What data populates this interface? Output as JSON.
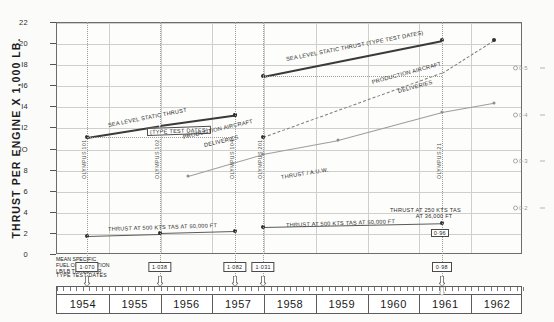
{
  "chart_data": {
    "type": "line",
    "title": "",
    "xlabel": "",
    "ylabel": "THRUST PER ENGINE X 1,000 LB.",
    "xlim": [
      1954,
      1963
    ],
    "ylim": [
      0,
      22
    ],
    "yticks": [
      0,
      2,
      4,
      6,
      8,
      10,
      12,
      14,
      16,
      18,
      20,
      22
    ],
    "ytick_labels": [
      "0",
      "2",
      "4",
      "6",
      "8",
      "IO",
      "I2",
      "I4",
      "I6",
      "I8",
      "20",
      "22"
    ],
    "right_axis_label": "",
    "right_ticks": [
      0.2,
      0.3,
      0.4,
      0.5
    ],
    "right_tick_labels": [
      "0·2",
      "0·3",
      "0·4",
      "0·5"
    ],
    "xtick_labels": [
      "1954",
      "1955",
      "1956",
      "1957",
      "1958",
      "1959",
      "1960",
      "1961",
      "1962"
    ],
    "grid": true,
    "legend_position": "inline-annotations",
    "series": [
      {
        "name": "SEA LEVEL STATIC THRUST (TYPE TEST DATES)",
        "style": "solid-thick",
        "axis": "left",
        "x": [
          1954.6,
          1956.0,
          1957.45,
          1958.0,
          1961.45
        ],
        "y": [
          11.1,
          12.2,
          13.2,
          16.9,
          20.3
        ],
        "markers": [
          true,
          false,
          true,
          true,
          true
        ]
      },
      {
        "name": "PRODUCTION AIRCRAFT DELIVERIES",
        "style": "dashed",
        "axis": "left",
        "x": [
          1957.45,
          1958.0,
          1961.45,
          1962.45
        ],
        "y": [
          13.2,
          11.1,
          17.2,
          20.3
        ],
        "markers": [
          true,
          true,
          false,
          true
        ]
      },
      {
        "name": "THRUST / A.U.W.",
        "style": "solid-thin",
        "axis": "right",
        "x": [
          1956.55,
          1958.0,
          1959.45,
          1961.45,
          1962.45
        ],
        "y": [
          0.268,
          0.315,
          0.345,
          0.405,
          0.425
        ],
        "markers": [
          true,
          true,
          true,
          true,
          true
        ]
      },
      {
        "name": "THRUST AT 500 KTS TAS AT 50,000 FT",
        "style": "solid-med",
        "axis": "left",
        "x": [
          1954.6,
          1956.0,
          1957.45
        ],
        "y": [
          1.75,
          1.95,
          2.15
        ],
        "markers": [
          true,
          true,
          true
        ]
      },
      {
        "name": "THRUST AT 250 KTS TAS AT 36,000 FT",
        "style": "solid-med",
        "axis": "left",
        "x": [
          1958.0,
          1961.45
        ],
        "y": [
          2.55,
          2.9
        ],
        "markers": [
          true,
          true
        ]
      }
    ],
    "annotations": [
      {
        "text": "SEA LEVEL STATIC THRUST",
        "kind": "line-label"
      },
      {
        "text": "(TYPE TEST DATES)",
        "kind": "line-label-box"
      },
      {
        "text": "SEA LEVEL STATIC THRUST  (TYPE TEST DATES)",
        "kind": "line-label"
      },
      {
        "text": "PRODUCTION AIRCRAFT",
        "kind": "line-label"
      },
      {
        "text": "DELIVERIES",
        "kind": "line-label"
      },
      {
        "text": "PRODUCTION AIRCRAFT",
        "kind": "line-label"
      },
      {
        "text": "DELIVERIES",
        "kind": "line-label"
      },
      {
        "text": "THRUST / A.U.W.",
        "kind": "line-label"
      },
      {
        "text": "THRUST AT 500 KTS TAS AT 50,000 FT",
        "kind": "line-label"
      },
      {
        "text": "THRUST AT 500 KTS TAS AT 50,000 FT",
        "kind": "line-label"
      },
      {
        "text": "THRUST AT 250 KTS TAS",
        "kind": "line-label"
      },
      {
        "text": "AT 36,000 FT",
        "kind": "line-label"
      }
    ],
    "engine_markers": [
      {
        "label": "OLYMPUS 101",
        "x": 1954.6
      },
      {
        "label": "OLYMPUS 102",
        "x": 1956.0
      },
      {
        "label": "OLYMPUS 104",
        "x": 1957.45
      },
      {
        "label": "OLYMPUS 201",
        "x": 1958.0
      },
      {
        "label": "OLYMPUS 21",
        "x": 1961.45
      }
    ],
    "fuel_consumption": {
      "caption_line1": "MEAN SPECIFIC",
      "caption_line2": "FUEL CONSUMPTION",
      "caption_line3": "LB/LB THRUST/HR.",
      "type_test_caption": "TYPE TEST DATES",
      "values": [
        {
          "value": "1·070",
          "x": 1954.6
        },
        {
          "value": "1·038",
          "x": 1956.0
        },
        {
          "value": "1·082",
          "x": 1957.45
        },
        {
          "value": "1·031",
          "x": 1958.0
        },
        {
          "value": "0·98",
          "x": 1961.45
        }
      ]
    },
    "inline_value_boxes": [
      {
        "value": "0·96",
        "x": 1961.45,
        "y": 2.33
      }
    ]
  }
}
